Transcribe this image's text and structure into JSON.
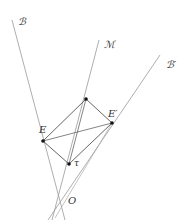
{
  "labels": {
    "B": "ℬ",
    "M": "ℳ",
    "B_prime": "ℬ′",
    "E": "E",
    "E_prime": "E′",
    "tau": "τ",
    "O": "O"
  },
  "colors": {
    "line": "#8a8a8a",
    "edge": "#555555",
    "point": "#111111"
  }
}
